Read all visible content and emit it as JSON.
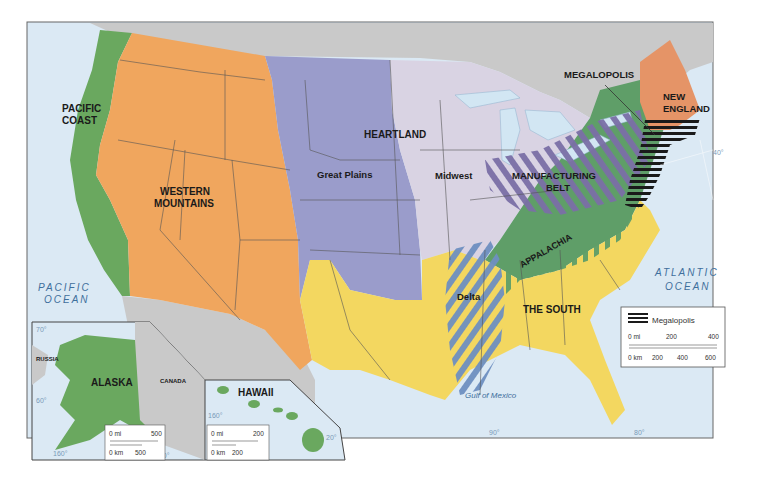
{
  "map": {
    "colors": {
      "ocean": "#dbe9f4",
      "canada_mexico": "#c9c9c9",
      "pacific_coast": "#6aa85f",
      "western_mountains": "#f0a65e",
      "great_plains": "#9a9ccb",
      "heartland_midwest": "#d9d3e3",
      "new_england": "#e59467",
      "appalachia": "#5f9e68",
      "the_south": "#f3d760",
      "manufacturing_belt_hatch": "#7a6fa6",
      "delta_hatch": "#6e8fc0",
      "megalopolis_hatch": "#1a1a1a",
      "lakes": "#d2e6f3"
    },
    "regions": {
      "pacific_coast": [
        "PACIFIC",
        "COAST"
      ],
      "western_mountains": [
        "WESTERN",
        "MOUNTAINS"
      ],
      "great_plains": "Great Plains",
      "heartland": "HEARTLAND",
      "midwest": "Midwest",
      "manufacturing_belt": [
        "MANUFACTURING",
        "BELT"
      ],
      "megalopolis": "MEGALOPOLIS",
      "new_england": [
        "NEW",
        "ENGLAND"
      ],
      "appalachia": "APPALACHIA",
      "delta": "Delta",
      "the_south": "THE SOUTH"
    },
    "water": {
      "pacific": [
        "PACIFIC",
        "OCEAN"
      ],
      "atlantic": [
        "ATLANTIC",
        "OCEAN"
      ],
      "gulf": "Gulf of Mexico"
    },
    "degrees": {
      "lat40": "40°",
      "lon90": "90°",
      "lon80": "80°"
    },
    "legend": {
      "item": "Megalopolis",
      "mi_labels": [
        "0 mi",
        "200",
        "400"
      ],
      "km_labels": [
        "0 km",
        "200",
        "400",
        "600"
      ]
    },
    "alaska_inset": {
      "title": "ALASKA",
      "russia": "RUSSIA",
      "canada": "CANADA",
      "deg70": "70°",
      "deg60": "60°",
      "deg160": "160°",
      "deg140": "140°",
      "scale_mi": [
        "0 mi",
        "500"
      ],
      "scale_km": [
        "0 km",
        "500"
      ]
    },
    "hawaii_inset": {
      "title": "HAWAII",
      "deg160": "160°",
      "deg20": "20°",
      "scale_mi": [
        "0 mi",
        "200"
      ],
      "scale_km": [
        "0 km",
        "200"
      ]
    }
  }
}
